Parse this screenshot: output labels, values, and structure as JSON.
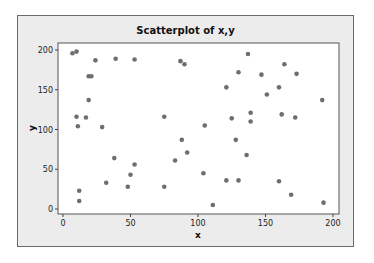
{
  "chart_data": {
    "type": "scatter",
    "title": "Scatterplot of x,y",
    "xlabel": "x",
    "ylabel": "y",
    "xlim": [
      -6,
      204
    ],
    "ylim": [
      -6,
      208
    ],
    "xticks": [
      0,
      50,
      100,
      150,
      200
    ],
    "yticks": [
      0,
      50,
      100,
      150,
      200
    ],
    "grid": false,
    "marker_color": "#6e6e6e",
    "points": [
      [
        7,
        196
      ],
      [
        10,
        198
      ],
      [
        24,
        187
      ],
      [
        39,
        189
      ],
      [
        53,
        188
      ],
      [
        19,
        167
      ],
      [
        21,
        167
      ],
      [
        19,
        137
      ],
      [
        10,
        116
      ],
      [
        17,
        115
      ],
      [
        11,
        104
      ],
      [
        29,
        103
      ],
      [
        38,
        64
      ],
      [
        53,
        56
      ],
      [
        50,
        43
      ],
      [
        32,
        33
      ],
      [
        48,
        28
      ],
      [
        12,
        23
      ],
      [
        12,
        10
      ],
      [
        75,
        116
      ],
      [
        75,
        28
      ],
      [
        87,
        186
      ],
      [
        90,
        182
      ],
      [
        88,
        87
      ],
      [
        92,
        71
      ],
      [
        83,
        61
      ],
      [
        105,
        105
      ],
      [
        104,
        45
      ],
      [
        111,
        5
      ],
      [
        121,
        153
      ],
      [
        125,
        114
      ],
      [
        128,
        87
      ],
      [
        121,
        36
      ],
      [
        130,
        36
      ],
      [
        130,
        172
      ],
      [
        137,
        195
      ],
      [
        139,
        121
      ],
      [
        139,
        110
      ],
      [
        136,
        68
      ],
      [
        147,
        169
      ],
      [
        151,
        144
      ],
      [
        160,
        153
      ],
      [
        162,
        119
      ],
      [
        160,
        35
      ],
      [
        164,
        182
      ],
      [
        173,
        170
      ],
      [
        172,
        115
      ],
      [
        169,
        18
      ],
      [
        192,
        137
      ],
      [
        193,
        8
      ]
    ]
  }
}
